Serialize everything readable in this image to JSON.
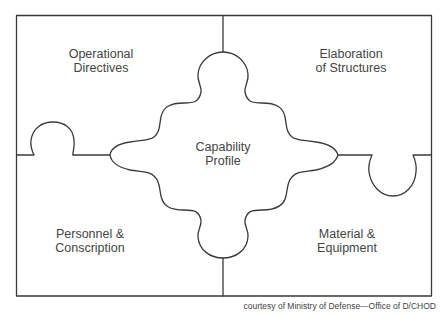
{
  "diagram": {
    "type": "puzzle",
    "pieces": [
      {
        "id": "top-left",
        "line1": "Operational",
        "line2": "Directives"
      },
      {
        "id": "top-right",
        "line1": "Elaboration",
        "line2": "of Structures"
      },
      {
        "id": "bottom-left",
        "line1": "Personnel &",
        "line2": "Conscription"
      },
      {
        "id": "bottom-right",
        "line1": "Material &",
        "line2": "Equipment"
      },
      {
        "id": "center",
        "line1": "Capability",
        "line2": "Profile"
      }
    ],
    "credit": "courtesy of Ministry of Defense—Office of D/CHOD",
    "colors": {
      "line": "#3a3a3a",
      "background": "#ffffff",
      "text": "#444444"
    }
  }
}
